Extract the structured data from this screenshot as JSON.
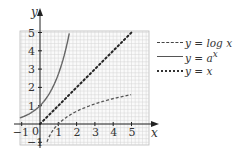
{
  "chart_data": {
    "type": "line",
    "title": "",
    "xlabel": "x",
    "ylabel": "y",
    "xlim": [
      -1,
      5.3
    ],
    "ylim": [
      -1,
      5
    ],
    "grid": true,
    "x_ticks": [
      "-1",
      "0",
      "1",
      "2",
      "3",
      "4",
      "5"
    ],
    "y_ticks": [
      "-1",
      "1",
      "2",
      "3",
      "4",
      "5"
    ],
    "legend_position": "right",
    "series": [
      {
        "name": "y = log x",
        "style": "dashed",
        "x": [
          0.4,
          0.6,
          0.8,
          1,
          1.5,
          2,
          3,
          4,
          5
        ],
        "values": [
          -0.92,
          -0.51,
          -0.22,
          0,
          0.41,
          0.69,
          1.1,
          1.39,
          1.61
        ]
      },
      {
        "name": "y = a^x",
        "style": "solid",
        "x": [
          -1,
          -0.5,
          0,
          0.5,
          0.8,
          1.0,
          1.2,
          1.3
        ],
        "values": [
          0.37,
          0.61,
          1,
          1.65,
          2.23,
          2.72,
          3.32,
          5
        ]
      },
      {
        "name": "y = x",
        "style": "dotted",
        "x": [
          0,
          5
        ],
        "values": [
          0,
          5
        ]
      }
    ]
  },
  "legend": {
    "items": [
      {
        "prefix": "y = log ",
        "var": "x",
        "style": "dashed"
      },
      {
        "prefix": "y = ",
        "var": "a",
        "sup": "x",
        "style": "solid"
      },
      {
        "prefix": "y = ",
        "var": "x",
        "style": "dotted"
      }
    ]
  },
  "axes": {
    "x_label": "x",
    "y_label": "y",
    "x_tick_labels": [
      "1",
      "2",
      "3",
      "4",
      "5"
    ],
    "y_tick_labels": [
      "1",
      "2",
      "3",
      "4",
      "5"
    ],
    "neg_x_label": "−1",
    "neg_y_label": "−1",
    "origin_label": "0"
  }
}
